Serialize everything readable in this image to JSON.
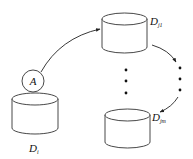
{
  "diagram": {
    "colors": {
      "stroke": "#333333",
      "background": "#ffffff",
      "text": "#111111"
    },
    "agent": {
      "label": "A"
    },
    "databases": [
      {
        "id": "source",
        "label_main": "D",
        "label_sub": "i"
      },
      {
        "id": "target-first",
        "label_main": "D",
        "label_sub": "j1"
      },
      {
        "id": "target-last",
        "label_main": "D",
        "label_sub": "jm"
      }
    ],
    "ellipsis": "vertical dots"
  }
}
